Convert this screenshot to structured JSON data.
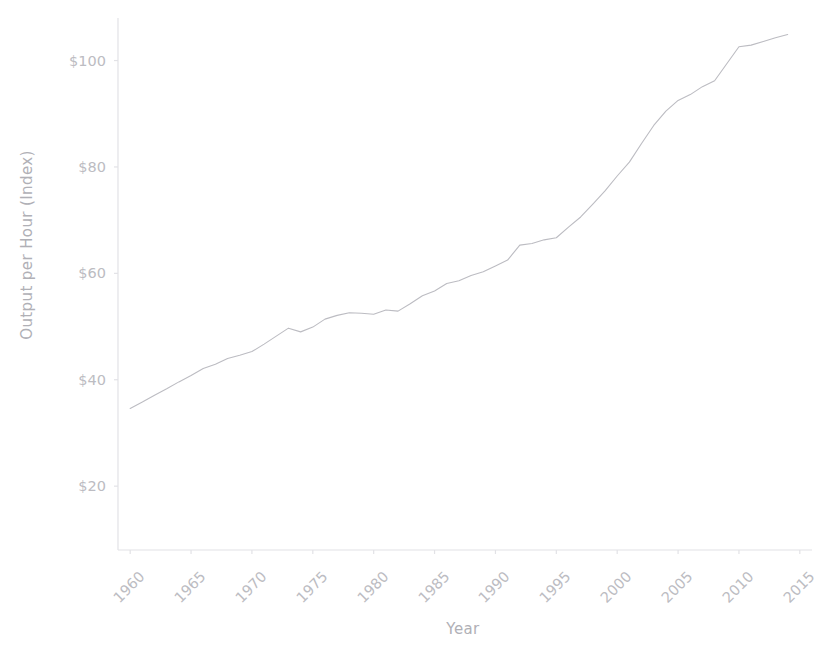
{
  "chart_data": {
    "type": "line",
    "title": "",
    "xlabel": "Year",
    "ylabel": "Output per Hour (Index)",
    "xlim": [
      1959,
      2016
    ],
    "ylim": [
      8,
      108
    ],
    "grid": false,
    "legend": null,
    "line_color": "#bcbcc2",
    "line_width": 1.1,
    "x_tick_labels": [
      "1960",
      "1965",
      "1970",
      "1975",
      "1980",
      "1985",
      "1990",
      "1995",
      "2000",
      "2005",
      "2010",
      "2015"
    ],
    "x_tick_values": [
      1960,
      1965,
      1970,
      1975,
      1980,
      1985,
      1990,
      1995,
      2000,
      2005,
      2010,
      2015
    ],
    "x_tick_rotation": -45,
    "y_tick_labels": [
      "$20",
      "$40",
      "$60",
      "$80",
      "$100"
    ],
    "y_tick_values": [
      20,
      40,
      60,
      80,
      100
    ],
    "series": [
      {
        "name": "Output per Hour (Index)",
        "x": [
          1960,
          1961,
          1962,
          1963,
          1964,
          1965,
          1966,
          1967,
          1968,
          1969,
          1970,
          1971,
          1972,
          1973,
          1974,
          1975,
          1976,
          1977,
          1978,
          1979,
          1980,
          1981,
          1982,
          1983,
          1984,
          1985,
          1986,
          1987,
          1988,
          1989,
          1990,
          1991,
          1992,
          1993,
          1994,
          1995,
          1996,
          1997,
          1998,
          1999,
          2000,
          2001,
          2002,
          2003,
          2004,
          2005,
          2006,
          2007,
          2008,
          2009,
          2010,
          2011,
          2012,
          2013,
          2014
        ],
        "values": [
          34.6,
          35.8,
          37.1,
          38.3,
          39.6,
          40.8,
          42.1,
          42.9,
          44.0,
          44.6,
          45.3,
          46.7,
          48.2,
          49.7,
          49.0,
          49.9,
          51.4,
          52.1,
          52.6,
          52.5,
          52.3,
          53.1,
          52.9,
          54.3,
          55.8,
          56.7,
          58.1,
          58.6,
          59.6,
          60.3,
          61.4,
          62.5,
          65.3,
          65.6,
          66.3,
          66.7,
          68.7,
          70.6,
          73.0,
          75.5,
          78.3,
          80.9,
          84.4,
          87.8,
          90.5,
          92.5,
          93.6,
          95.1,
          96.2,
          99.4,
          102.6,
          102.9,
          103.6,
          104.3,
          104.9
        ]
      }
    ]
  },
  "axes": {
    "y_title": "Output per Hour (Index)",
    "x_title": "Year"
  }
}
